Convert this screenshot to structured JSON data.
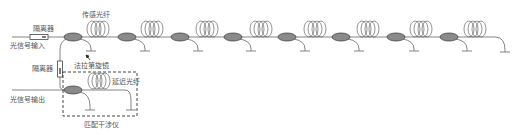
{
  "diagram": {
    "type": "fiber-optic sensing array schematic",
    "labels": {
      "isolator_input": "隔离器",
      "signal_input": "光信号输入",
      "sensing_fiber": "传感光纤",
      "faraday_mirror": "法拉第旋镜",
      "isolator_output": "隔离器",
      "signal_output": "光信号输出",
      "reference_fiber": "延迟光纤",
      "matched_interferometer": "匹配干涉仪"
    },
    "colors": {
      "line": "#666666",
      "coupler_fill": "#8a8a8a",
      "coupler_stroke": "#333333",
      "dashed_box": "#333333",
      "text": "#555555"
    },
    "main_line_y": 37,
    "couplers_x": [
      73,
      127,
      180,
      233,
      287,
      341,
      396,
      449
    ],
    "sensing_coils_x": [
      98,
      152,
      207,
      261,
      315,
      368,
      421,
      475
    ],
    "sensor_count": 8
  }
}
